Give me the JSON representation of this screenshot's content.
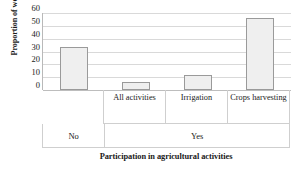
{
  "chart_data": {
    "type": "bar",
    "title": "",
    "xlabel": "Participation in agricultural activities",
    "ylabel": "Proportion of women (%)",
    "categories": [
      "",
      "All activities",
      "Irrigation",
      "Crops harvesting"
    ],
    "values": [
      33.5,
      6.0,
      11.5,
      56.0
    ],
    "ylim": [
      0,
      60
    ],
    "yticks": [
      0,
      10,
      20,
      30,
      40,
      50,
      60
    ],
    "ytick_labels": [
      "0",
      "10",
      "20",
      "30",
      "40",
      "50",
      "60"
    ],
    "grid": true,
    "legend": "none",
    "groups": [
      {
        "label": "No",
        "span": 1
      },
      {
        "label": "Yes",
        "span": 3
      }
    ],
    "bar_fill": "#efefef",
    "bar_edge": "#9a9a9a",
    "grid_color": "#d9d9d9"
  }
}
